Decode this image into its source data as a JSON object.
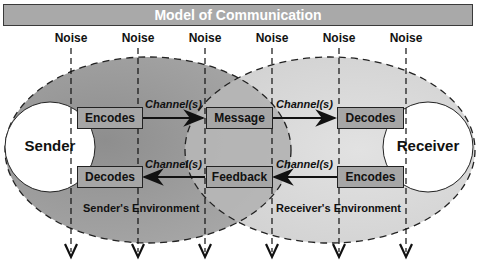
{
  "title": "Model of Communication",
  "noise": {
    "labels": [
      "Noise",
      "Noise",
      "Noise",
      "Noise",
      "Noise",
      "Noise"
    ]
  },
  "sender": {
    "label": "Sender",
    "encode_box": "Encodes",
    "decode_box": "Decodes",
    "environment": "Sender's Environment"
  },
  "receiver": {
    "label": "Receiver",
    "decode_box": "Decodes",
    "encode_box": "Encodes",
    "environment": "Receiver's Environment"
  },
  "middle": {
    "message_box": "Message",
    "feedback_box": "Feedback"
  },
  "channels": {
    "top_left": "Channel(s)",
    "top_right": "Channel(s)",
    "bottom_left": "Channel(s)",
    "bottom_right": "Channel(s)"
  },
  "colors": {
    "sender_env": "#9c9c9c",
    "receiver_env": "#d6d6d6",
    "overlap": "#b8b8b8",
    "box_fill": "#a6a6a6",
    "title_fill": "#a9a9a9"
  }
}
